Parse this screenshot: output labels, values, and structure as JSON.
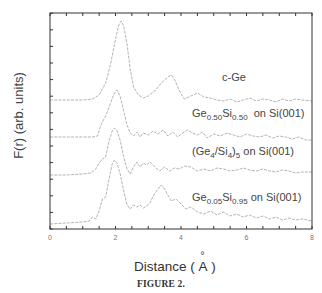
{
  "chart_data": {
    "type": "line",
    "title": "",
    "xlabel": "Distance ( Å )",
    "ylabel": "F(r) (arb. units)",
    "caption": "FIGURE 2.",
    "xlim": [
      0,
      8
    ],
    "ylim": [
      0,
      216
    ],
    "x_ticks": [
      0,
      2,
      4,
      6,
      8
    ],
    "x_tick_labels": [
      "0",
      "2",
      "4",
      "6",
      "8"
    ],
    "x_minor_tick_step": 0.5,
    "grid": false,
    "legend": "inline labels",
    "series": [
      {
        "name": "c-Ge",
        "label_parts": [
          {
            "t": "c-Ge"
          }
        ],
        "label_pos": [
          222,
          77
        ],
        "color": "#aaaaaa",
        "points": [
          [
            0,
            129
          ],
          [
            0.5,
            129
          ],
          [
            1.0,
            129
          ],
          [
            1.3,
            130
          ],
          [
            1.5,
            134
          ],
          [
            1.7,
            146
          ],
          [
            1.85,
            165
          ],
          [
            2.0,
            190
          ],
          [
            2.1,
            204
          ],
          [
            2.17,
            208
          ],
          [
            2.25,
            203
          ],
          [
            2.35,
            185
          ],
          [
            2.45,
            160
          ],
          [
            2.55,
            142
          ],
          [
            2.7,
            134
          ],
          [
            2.85,
            131
          ],
          [
            3.0,
            133
          ],
          [
            3.2,
            138
          ],
          [
            3.4,
            146
          ],
          [
            3.6,
            152
          ],
          [
            3.7,
            154
          ],
          [
            3.8,
            150
          ],
          [
            3.95,
            138
          ],
          [
            4.1,
            130
          ],
          [
            4.3,
            133
          ],
          [
            4.5,
            136
          ],
          [
            4.7,
            132
          ],
          [
            4.9,
            131
          ],
          [
            5.1,
            129
          ],
          [
            5.3,
            128
          ],
          [
            5.5,
            130
          ],
          [
            5.7,
            127
          ],
          [
            5.9,
            129
          ],
          [
            6.1,
            131
          ],
          [
            6.3,
            128
          ],
          [
            6.5,
            130
          ],
          [
            6.7,
            129
          ],
          [
            6.9,
            127
          ],
          [
            7.1,
            130
          ],
          [
            7.3,
            128
          ],
          [
            7.5,
            130
          ],
          [
            7.7,
            129
          ],
          [
            8.0,
            128
          ]
        ]
      },
      {
        "name": "Ge0.50Si0.50 on Si(001)",
        "label_parts": [
          {
            "t": "Ge"
          },
          {
            "sub": "0.50"
          },
          {
            "t": "Si"
          },
          {
            "sub": "0.50"
          },
          {
            "t": "  on Si(001)"
          }
        ],
        "label_pos": [
          192,
          113
        ],
        "color": "#aaaaaa",
        "points": [
          [
            0,
            92
          ],
          [
            0.5,
            92
          ],
          [
            1.0,
            92
          ],
          [
            1.3,
            92
          ],
          [
            1.45,
            93
          ],
          [
            1.55,
            104
          ],
          [
            1.7,
            113
          ],
          [
            1.85,
            126
          ],
          [
            1.95,
            135
          ],
          [
            2.05,
            139
          ],
          [
            2.15,
            132
          ],
          [
            2.25,
            118
          ],
          [
            2.35,
            104
          ],
          [
            2.45,
            96
          ],
          [
            2.55,
            93
          ],
          [
            2.65,
            97
          ],
          [
            2.75,
            92
          ],
          [
            2.85,
            96
          ],
          [
            3.0,
            94
          ],
          [
            3.15,
            98
          ],
          [
            3.3,
            95
          ],
          [
            3.45,
            99
          ],
          [
            3.6,
            93
          ],
          [
            3.75,
            97
          ],
          [
            3.9,
            92
          ],
          [
            4.05,
            96
          ],
          [
            4.2,
            99
          ],
          [
            4.35,
            96
          ],
          [
            4.5,
            94
          ],
          [
            4.65,
            97
          ],
          [
            4.8,
            91
          ],
          [
            5.0,
            95
          ],
          [
            5.2,
            93
          ],
          [
            5.4,
            96
          ],
          [
            5.6,
            94
          ],
          [
            5.8,
            92
          ],
          [
            6.0,
            95
          ],
          [
            6.2,
            93
          ],
          [
            6.4,
            92
          ],
          [
            6.6,
            94
          ],
          [
            6.8,
            91
          ],
          [
            7.0,
            93
          ],
          [
            7.2,
            92
          ],
          [
            7.4,
            90
          ],
          [
            7.6,
            92
          ],
          [
            7.8,
            89
          ],
          [
            8.0,
            89
          ]
        ]
      },
      {
        "name": "(Ge4/Si4)5 on Si(001)",
        "label_parts": [
          {
            "t": "(Ge"
          },
          {
            "sub": "4"
          },
          {
            "t": "/Si"
          },
          {
            "sub": "4"
          },
          {
            "t": ")"
          },
          {
            "sub": "5"
          },
          {
            "t": " on Si(001)"
          }
        ],
        "label_pos": [
          192,
          151
        ],
        "color": "#aaaaaa",
        "points": [
          [
            0,
            54
          ],
          [
            0.5,
            54
          ],
          [
            1.0,
            55
          ],
          [
            1.25,
            56
          ],
          [
            1.4,
            60
          ],
          [
            1.5,
            66
          ],
          [
            1.6,
            70
          ],
          [
            1.7,
            72
          ],
          [
            1.8,
            88
          ],
          [
            1.9,
            98
          ],
          [
            1.97,
            101
          ],
          [
            2.05,
            98
          ],
          [
            2.15,
            88
          ],
          [
            2.25,
            72
          ],
          [
            2.35,
            60
          ],
          [
            2.45,
            55
          ],
          [
            2.55,
            62
          ],
          [
            2.65,
            67
          ],
          [
            2.75,
            62
          ],
          [
            2.85,
            66
          ],
          [
            2.95,
            64
          ],
          [
            3.05,
            67
          ],
          [
            3.2,
            62
          ],
          [
            3.35,
            58
          ],
          [
            3.5,
            62
          ],
          [
            3.65,
            58
          ],
          [
            3.8,
            61
          ],
          [
            3.95,
            60
          ],
          [
            4.1,
            63
          ],
          [
            4.3,
            62
          ],
          [
            4.5,
            58
          ],
          [
            4.7,
            60
          ],
          [
            4.9,
            58
          ],
          [
            5.1,
            61
          ],
          [
            5.3,
            60
          ],
          [
            5.5,
            58
          ],
          [
            5.7,
            59
          ],
          [
            5.9,
            61
          ],
          [
            6.1,
            59
          ],
          [
            6.3,
            58
          ],
          [
            6.5,
            60
          ],
          [
            6.7,
            58
          ],
          [
            6.9,
            57
          ],
          [
            7.1,
            59
          ],
          [
            7.3,
            58
          ],
          [
            7.5,
            56
          ],
          [
            7.7,
            57
          ],
          [
            8.0,
            57
          ]
        ]
      },
      {
        "name": "Ge0.05Si0.95 on Si(001)",
        "label_parts": [
          {
            "t": "Ge"
          },
          {
            "sub": "0.05"
          },
          {
            "t": "Si"
          },
          {
            "sub": "0.95"
          },
          {
            "t": " on Si(001)"
          }
        ],
        "label_pos": [
          192,
          197
        ],
        "color": "#aaaaaa",
        "points": [
          [
            0,
            5
          ],
          [
            0.5,
            6
          ],
          [
            1.0,
            7
          ],
          [
            1.2,
            8
          ],
          [
            1.3,
            12
          ],
          [
            1.4,
            10
          ],
          [
            1.5,
            18
          ],
          [
            1.6,
            30
          ],
          [
            1.7,
            32
          ],
          [
            1.8,
            50
          ],
          [
            1.9,
            65
          ],
          [
            1.97,
            69
          ],
          [
            2.05,
            66
          ],
          [
            2.15,
            54
          ],
          [
            2.25,
            38
          ],
          [
            2.35,
            24
          ],
          [
            2.45,
            20
          ],
          [
            2.55,
            24
          ],
          [
            2.65,
            22
          ],
          [
            2.75,
            24
          ],
          [
            2.85,
            21
          ],
          [
            2.95,
            23
          ],
          [
            3.05,
            26
          ],
          [
            3.15,
            33
          ],
          [
            3.3,
            40
          ],
          [
            3.4,
            44
          ],
          [
            3.5,
            40
          ],
          [
            3.6,
            34
          ],
          [
            3.7,
            28
          ],
          [
            3.85,
            30
          ],
          [
            4.0,
            25
          ],
          [
            4.15,
            20
          ],
          [
            4.3,
            22
          ],
          [
            4.5,
            17
          ],
          [
            4.7,
            15
          ],
          [
            4.9,
            18
          ],
          [
            5.1,
            14
          ],
          [
            5.3,
            17
          ],
          [
            5.5,
            13
          ],
          [
            5.7,
            15
          ],
          [
            5.9,
            12
          ],
          [
            6.1,
            14
          ],
          [
            6.3,
            11
          ],
          [
            6.5,
            13
          ],
          [
            6.7,
            10
          ],
          [
            6.9,
            12
          ],
          [
            7.1,
            9
          ],
          [
            7.3,
            11
          ],
          [
            7.5,
            9
          ],
          [
            7.7,
            10
          ],
          [
            8.0,
            8
          ]
        ]
      }
    ]
  },
  "axes": {
    "ylabel": "F(r) (arb. units)",
    "xlabel_text": "Distance ( ",
    "xlabel_unit_ring": "°",
    "xlabel_unit": "A",
    "xlabel_close": " )"
  },
  "caption": "FIGURE 2."
}
